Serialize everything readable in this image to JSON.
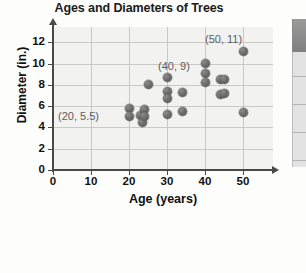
{
  "chart_data": {
    "type": "scatter",
    "title": "Ages and Diameters of Trees",
    "xlabel": "Age (years)",
    "ylabel": "Diameter (in.)",
    "xlim": [
      0,
      55
    ],
    "ylim": [
      0,
      13
    ],
    "xticks": [
      "0",
      "10",
      "20",
      "30",
      "40",
      "50"
    ],
    "xtick_values": [
      0,
      10,
      20,
      30,
      40,
      50
    ],
    "yticks": [
      "0",
      "2",
      "4",
      "6",
      "8",
      "10",
      "12"
    ],
    "ytick_values": [
      0,
      2,
      4,
      6,
      8,
      10,
      12
    ],
    "grid": true,
    "legend": "none",
    "points": [
      {
        "x": 20,
        "y": 5.8
      },
      {
        "x": 20,
        "y": 5.0
      },
      {
        "x": 23,
        "y": 5.1
      },
      {
        "x": 23.5,
        "y": 4.5
      },
      {
        "x": 24,
        "y": 5.7
      },
      {
        "x": 24,
        "y": 5.0
      },
      {
        "x": 25,
        "y": 8.0
      },
      {
        "x": 30,
        "y": 8.7
      },
      {
        "x": 30,
        "y": 7.4
      },
      {
        "x": 30,
        "y": 6.7
      },
      {
        "x": 30,
        "y": 5.2
      },
      {
        "x": 34,
        "y": 7.3
      },
      {
        "x": 34,
        "y": 5.5
      },
      {
        "x": 40,
        "y": 10.0
      },
      {
        "x": 40,
        "y": 9.1
      },
      {
        "x": 40,
        "y": 8.2
      },
      {
        "x": 44,
        "y": 8.5
      },
      {
        "x": 45,
        "y": 8.5
      },
      {
        "x": 44,
        "y": 7.1
      },
      {
        "x": 45,
        "y": 7.2
      },
      {
        "x": 50,
        "y": 11.1
      },
      {
        "x": 50,
        "y": 5.4
      }
    ],
    "annotations": [
      {
        "label": "(20, 5.5)",
        "x_px": 58,
        "y_px": 110
      },
      {
        "label": "(40, 9)",
        "x_px": 158,
        "y_px": 60
      },
      {
        "label": "(50, 11)",
        "x_px": 205,
        "y_px": 33
      }
    ]
  }
}
